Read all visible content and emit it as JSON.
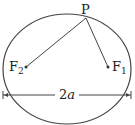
{
  "diagram": {
    "type": "ellipse-foci",
    "colors": {
      "stroke": "#444444",
      "text": "#222222",
      "background": "#ffffff"
    },
    "ellipse": {
      "cx": 67,
      "cy": 69,
      "rx": 64,
      "ry": 55
    },
    "point_p": {
      "label": "P",
      "x": 86,
      "y": 17
    },
    "focus_1": {
      "label": "F",
      "subscript": "1",
      "x": 108,
      "y": 67
    },
    "focus_2": {
      "label": "F",
      "subscript": "2",
      "x": 26,
      "y": 67
    },
    "major_axis": {
      "label_number": "2",
      "label_var": "a",
      "y": 95,
      "x1": 3,
      "x2": 131
    }
  }
}
